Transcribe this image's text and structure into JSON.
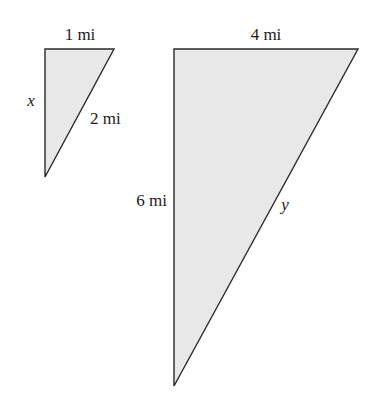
{
  "figure": {
    "fill_color": "#e8e8e8",
    "stroke_color": "#2a2a2a",
    "small_triangle": {
      "top_label": "1 mi",
      "left_label": "x",
      "hypotenuse_label": "2 mi"
    },
    "large_triangle": {
      "top_label": "4 mi",
      "left_label": "6 mi",
      "hypotenuse_label": "y"
    }
  }
}
